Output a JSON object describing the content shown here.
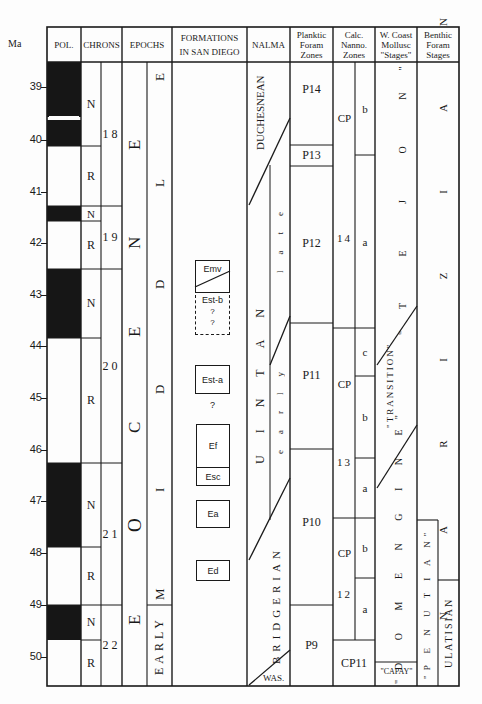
{
  "headers": {
    "ma": "Ma",
    "pol": "POL.",
    "chrons": "CHRONS",
    "epochs": "EPOCHS",
    "formations_line1": "FORMATIONS",
    "formations_line2": "IN SAN DIEGO",
    "nalma": "NALMA",
    "planktic_line1": "Planktic",
    "planktic_line2": "Foram",
    "planktic_line3": "Zones",
    "calc_line1": "Calc.",
    "calc_line2": "Nanno.",
    "calc_line3": "Zones",
    "wcoast_line1": "W. Coast",
    "wcoast_line2": "Mollusc",
    "wcoast_line3": "\"Stages\"",
    "benthic_line1": "Benthic",
    "benthic_line2": "Foram",
    "benthic_line3": "Stages"
  },
  "ma_ticks": [
    "39",
    "40",
    "41",
    "42",
    "43",
    "44",
    "45",
    "46",
    "47",
    "48",
    "49",
    "50"
  ],
  "chrons": {
    "polarity": [
      "N",
      "R",
      "N",
      "R",
      "N",
      "R",
      "N",
      "R",
      "N",
      "R"
    ],
    "numbers": [
      "18",
      "19",
      "20",
      "21",
      "22"
    ]
  },
  "epochs": {
    "main": "EOCENE",
    "main_letters": [
      "E",
      "N",
      "E",
      "C",
      "O",
      "E"
    ],
    "sub_middle_letters": [
      "E",
      "L",
      "D",
      "D",
      "I",
      "M"
    ],
    "sub_early": "EARLY"
  },
  "formations": {
    "emv": "Emv",
    "est_b": "Est-b",
    "q1": "?",
    "q2": "?",
    "est_a": "Est-a",
    "q3": "?",
    "ef": "Ef",
    "esc": "Esc",
    "ea": "Ea",
    "ed": "Ed"
  },
  "nalma": {
    "duchesnean": "DUCHESNEAN",
    "uintan": "UINTAN",
    "late": "late",
    "early": "early",
    "bridgerian": "BRIDGERIAN",
    "was": "WAS."
  },
  "planktic": [
    "P14",
    "P13",
    "P12",
    "P11",
    "P10",
    "P9"
  ],
  "calc_nanno": {
    "cp14_a": "CP",
    "cp14_b": "14",
    "cp13_a": "CP",
    "cp13_b": "13",
    "cp12_a": "CP",
    "cp12_b": "12",
    "cp11": "CP11",
    "subzones": [
      "b",
      "a",
      "c",
      "b",
      "a",
      "b",
      "a"
    ]
  },
  "wcoast": {
    "tejon": "\"T E J O N\"",
    "tejon_top": "N\"",
    "transition": "\"TRANSITION\"",
    "transition_t": "\"T",
    "domengine": "\"D O M E N G I N E\"",
    "capay": "\"CAPAY\""
  },
  "benthic": {
    "narizian": "N A R I Z I A N",
    "penutian": "\"P E N U T I A N\"",
    "ulatisian": "ULATISIAN"
  }
}
